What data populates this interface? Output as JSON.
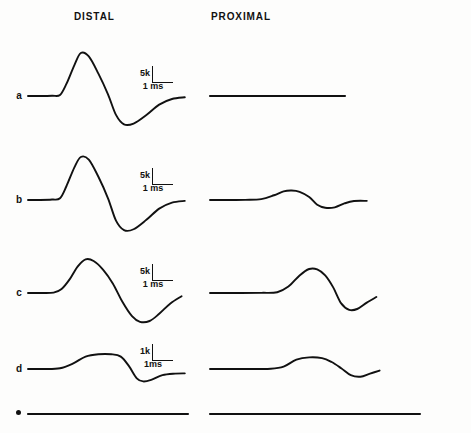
{
  "figure": {
    "background_color": "#fdfdfc",
    "trace_color": "#111111",
    "width": 471,
    "height": 433,
    "columns": [
      {
        "id": "distal",
        "label": "DISTAL"
      },
      {
        "id": "proximal",
        "label": "PROXIMAL"
      }
    ],
    "row_labels": [
      "a",
      "b",
      "c",
      "d",
      "e"
    ]
  },
  "chart_data": {
    "type": "line",
    "title": "",
    "subtitle": "",
    "xlabel": "",
    "ylabel": "",
    "grid": false,
    "legend": "none",
    "x_units": "ms",
    "y_units": "k",
    "rows": [
      {
        "label": "a",
        "scale": {
          "amplitude": "5k",
          "time": "1 ms"
        },
        "distal": {
          "response": "large biphasic",
          "peak_amplitude_k": 5.0,
          "trough_amplitude_k": -3.3,
          "onset_ms": 0.9,
          "peak_ms": 1.6,
          "trough_ms": 2.9,
          "points": [
            [
              0,
              0
            ],
            [
              0.35,
              0
            ],
            [
              0.75,
              0.03
            ],
            [
              1.0,
              0.12
            ],
            [
              1.2,
              1.4
            ],
            [
              1.45,
              3.6
            ],
            [
              1.65,
              5.0
            ],
            [
              1.9,
              4.6
            ],
            [
              2.2,
              2.6
            ],
            [
              2.5,
              0.2
            ],
            [
              2.75,
              -2.2
            ],
            [
              3.0,
              -3.3
            ],
            [
              3.3,
              -3.2
            ],
            [
              3.7,
              -2.2
            ],
            [
              4.1,
              -1.0
            ],
            [
              4.5,
              -0.35
            ],
            [
              4.9,
              -0.15
            ]
          ]
        },
        "proximal": {
          "response": "flat / no response",
          "peak_amplitude_k": 0.0,
          "trough_amplitude_k": 0.0,
          "points": [
            [
              0,
              0
            ],
            [
              1,
              0
            ],
            [
              2,
              0
            ],
            [
              3,
              0
            ],
            [
              4,
              0
            ],
            [
              5,
              0
            ]
          ]
        }
      },
      {
        "label": "b",
        "scale": {
          "amplitude": "5k",
          "time": "1 ms"
        },
        "distal": {
          "response": "large biphasic",
          "peak_amplitude_k": 5.0,
          "trough_amplitude_k": -3.5,
          "onset_ms": 0.9,
          "peak_ms": 1.6,
          "trough_ms": 2.9,
          "points": [
            [
              0,
              0
            ],
            [
              0.35,
              0
            ],
            [
              0.75,
              0.05
            ],
            [
              1.0,
              0.2
            ],
            [
              1.2,
              1.6
            ],
            [
              1.45,
              3.8
            ],
            [
              1.65,
              5.0
            ],
            [
              1.9,
              4.7
            ],
            [
              2.2,
              2.7
            ],
            [
              2.5,
              0.2
            ],
            [
              2.75,
              -2.4
            ],
            [
              3.0,
              -3.5
            ],
            [
              3.3,
              -3.4
            ],
            [
              3.7,
              -2.3
            ],
            [
              4.1,
              -1.0
            ],
            [
              4.5,
              -0.3
            ],
            [
              4.9,
              -0.1
            ]
          ]
        },
        "proximal": {
          "response": "small biphasic",
          "peak_amplitude_k": 1.1,
          "trough_amplitude_k": -0.9,
          "onset_ms": 1.6,
          "peak_ms": 2.5,
          "trough_ms": 3.5,
          "points": [
            [
              0,
              0
            ],
            [
              0.6,
              0
            ],
            [
              1.1,
              0.02
            ],
            [
              1.6,
              0.1
            ],
            [
              2.0,
              0.55
            ],
            [
              2.3,
              1.0
            ],
            [
              2.55,
              1.1
            ],
            [
              2.8,
              0.95
            ],
            [
              3.1,
              0.35
            ],
            [
              3.35,
              -0.55
            ],
            [
              3.6,
              -0.9
            ],
            [
              3.9,
              -0.85
            ],
            [
              4.2,
              -0.4
            ],
            [
              4.5,
              -0.12
            ],
            [
              4.9,
              -0.1
            ]
          ]
        }
      },
      {
        "label": "c",
        "scale": {
          "amplitude": "5k",
          "time": "1 ms"
        },
        "distal": {
          "response": "broad biphasic",
          "peak_amplitude_k": 4.2,
          "trough_amplitude_k": -3.6,
          "onset_ms": 0.8,
          "peak_ms": 1.75,
          "trough_ms": 3.2,
          "points": [
            [
              0,
              0
            ],
            [
              0.4,
              0
            ],
            [
              0.8,
              0.05
            ],
            [
              1.05,
              0.5
            ],
            [
              1.3,
              1.7
            ],
            [
              1.55,
              3.3
            ],
            [
              1.8,
              4.2
            ],
            [
              2.05,
              4.0
            ],
            [
              2.35,
              2.9
            ],
            [
              2.65,
              1.2
            ],
            [
              2.95,
              -1.1
            ],
            [
              3.25,
              -2.9
            ],
            [
              3.5,
              -3.6
            ],
            [
              3.8,
              -3.5
            ],
            [
              4.1,
              -2.6
            ],
            [
              4.45,
              -1.3
            ],
            [
              4.8,
              -0.4
            ]
          ]
        },
        "proximal": {
          "response": "large delayed biphasic",
          "peak_amplitude_k": 3.0,
          "trough_amplitude_k": -2.1,
          "onset_ms": 2.1,
          "peak_ms": 3.2,
          "trough_ms": 4.2,
          "points": [
            [
              0,
              0
            ],
            [
              0.8,
              0
            ],
            [
              1.6,
              0.02
            ],
            [
              2.1,
              0.1
            ],
            [
              2.45,
              0.8
            ],
            [
              2.8,
              2.2
            ],
            [
              3.1,
              3.0
            ],
            [
              3.35,
              2.95
            ],
            [
              3.6,
              2.2
            ],
            [
              3.85,
              0.7
            ],
            [
              4.1,
              -1.3
            ],
            [
              4.35,
              -2.1
            ],
            [
              4.6,
              -2.0
            ],
            [
              4.9,
              -1.2
            ],
            [
              5.2,
              -0.5
            ]
          ]
        }
      },
      {
        "label": "d",
        "scale": {
          "amplitude": "1k",
          "time": "1ms"
        },
        "distal": {
          "response": "low amplitude biphasic",
          "peak_amplitude_k": 0.95,
          "trough_amplitude_k": -0.8,
          "onset_ms": 1.0,
          "peak_ms": 2.2,
          "trough_ms": 3.5,
          "points": [
            [
              0,
              0
            ],
            [
              0.5,
              0
            ],
            [
              1.0,
              0.05
            ],
            [
              1.4,
              0.35
            ],
            [
              1.8,
              0.8
            ],
            [
              2.2,
              0.95
            ],
            [
              2.6,
              0.95
            ],
            [
              2.9,
              0.8
            ],
            [
              3.15,
              0.2
            ],
            [
              3.4,
              -0.6
            ],
            [
              3.6,
              -0.8
            ],
            [
              3.85,
              -0.7
            ],
            [
              4.2,
              -0.4
            ],
            [
              4.6,
              -0.3
            ],
            [
              4.9,
              -0.28
            ]
          ]
        },
        "proximal": {
          "response": "low amplitude biphasic",
          "peak_amplitude_k": 0.75,
          "trough_amplitude_k": -0.5,
          "onset_ms": 2.3,
          "peak_ms": 3.2,
          "trough_ms": 4.4,
          "points": [
            [
              0,
              0
            ],
            [
              1.0,
              0
            ],
            [
              1.9,
              0.02
            ],
            [
              2.3,
              0.15
            ],
            [
              2.7,
              0.6
            ],
            [
              3.1,
              0.75
            ],
            [
              3.5,
              0.7
            ],
            [
              3.8,
              0.45
            ],
            [
              4.1,
              0.05
            ],
            [
              4.4,
              -0.4
            ],
            [
              4.7,
              -0.5
            ],
            [
              5.0,
              -0.3
            ],
            [
              5.3,
              -0.1
            ]
          ]
        }
      },
      {
        "label": "e",
        "scale": null,
        "distal": {
          "response": "flat / no response",
          "peak_amplitude_k": 0.0,
          "trough_amplitude_k": 0.0,
          "points": [
            [
              0,
              0
            ],
            [
              1,
              0
            ],
            [
              2,
              0
            ],
            [
              3,
              0
            ],
            [
              4,
              0
            ],
            [
              5,
              0
            ]
          ]
        },
        "proximal": {
          "response": "flat / no response",
          "peak_amplitude_k": 0.0,
          "trough_amplitude_k": 0.0,
          "points": [
            [
              0,
              0
            ],
            [
              1,
              0
            ],
            [
              2,
              0
            ],
            [
              3,
              0
            ],
            [
              4,
              0
            ],
            [
              5,
              0
            ]
          ]
        }
      }
    ]
  }
}
